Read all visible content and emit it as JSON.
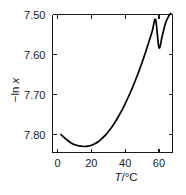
{
  "chart_data": {
    "type": "line",
    "title": "",
    "xlabel": "T/°C",
    "ylabel": "−ln x",
    "xlabel_parts": {
      "symbol": "T",
      "unit": "/°C"
    },
    "ylabel_parts": {
      "prefix": "−ln ",
      "symbol": "x"
    },
    "xlim": [
      -3,
      68
    ],
    "ylim": [
      7.5,
      7.845
    ],
    "y_axis_inverted": true,
    "grid": false,
    "legend": null,
    "xticks": [
      0,
      20,
      40,
      60
    ],
    "xticklabels": [
      "0",
      "20",
      "40",
      "60"
    ],
    "yticks": [
      7.5,
      7.6,
      7.7,
      7.8
    ],
    "yticklabels": [
      "7.50",
      "7.60",
      "7.70",
      "7.80"
    ],
    "series": [
      {
        "name": "solubility",
        "color": "#000000",
        "x": [
          2,
          4,
          6,
          8,
          10,
          12,
          14,
          16,
          18,
          20,
          22,
          24,
          26,
          28,
          30,
          32,
          34,
          36,
          38,
          40,
          42,
          44,
          46,
          48,
          50,
          52,
          54,
          56,
          58,
          60,
          62,
          64,
          66,
          67
        ],
        "y": [
          7.8,
          7.808,
          7.815,
          7.821,
          7.825,
          7.828,
          7.829,
          7.83,
          7.829,
          7.827,
          7.823,
          7.818,
          7.811,
          7.803,
          7.793,
          7.782,
          7.769,
          7.755,
          7.74,
          7.723,
          7.705,
          7.686,
          7.665,
          7.643,
          7.62,
          7.595,
          7.569,
          7.542,
          7.513,
          7.583,
          7.552,
          7.52,
          7.502,
          7.497
        ]
      }
    ],
    "minimum": {
      "x": 16,
      "y": 7.83
    },
    "annotations": []
  },
  "figure": {
    "background_color": "#ffffff",
    "axis_color": "#1a1a1a",
    "curve_color": "#000000"
  }
}
